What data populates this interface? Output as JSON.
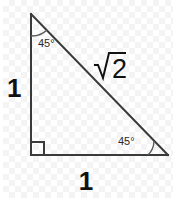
{
  "figure": {
    "name": "45-45-90-right-triangle",
    "stroke_color": "#3a3a3a",
    "text_color": "#111111",
    "background_color": "#ffffff",
    "checker_color": "#f4f4f4"
  },
  "labels": {
    "left_leg": "1",
    "bottom_leg": "1",
    "hypotenuse_radicand": "2",
    "hypotenuse_full": "√2",
    "top_angle": "45°",
    "bottom_right_angle": "45°",
    "right_angle_marker": "90°"
  },
  "geometry": {
    "apex": [
      31,
      14
    ],
    "bottom_left": [
      31,
      155
    ],
    "bottom_right": [
      168,
      155
    ],
    "top_arc_radius": 22,
    "bottom_arc_radius": 20,
    "right_angle_box_size": 13
  }
}
